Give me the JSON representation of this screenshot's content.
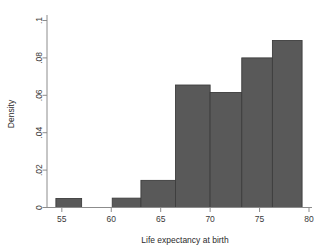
{
  "chart_data": {
    "type": "bar",
    "title": "",
    "subtitle": "",
    "xlabel": "Life expectancy at birth",
    "ylabel": "Density",
    "xlim": [
      53.5,
      80
    ],
    "ylim": [
      0,
      0.103
    ],
    "xticks": [
      "55",
      "60",
      "65",
      "70",
      "75",
      "80"
    ],
    "xtick_values": [
      55,
      60,
      65,
      70,
      75,
      80
    ],
    "yticks": [
      "0",
      ".02",
      ".04",
      ".06",
      ".08",
      ".1"
    ],
    "ytick_values": [
      0,
      0.02,
      0.04,
      0.06,
      0.08,
      0.1
    ],
    "grid": false,
    "legend": "none",
    "bar_color": "#595959",
    "bar_edge_color": "#3d3d3d",
    "background_color": "#ffffff",
    "axis_color": "#8c8c8c",
    "bins": [
      {
        "label": "54.4-57.0",
        "x0": 54.4,
        "x1": 57.0,
        "value": 0.0048
      },
      {
        "label": "60.1-63.0",
        "x0": 60.1,
        "x1": 63.0,
        "value": 0.005
      },
      {
        "label": "63.0-66.5",
        "x0": 63.0,
        "x1": 66.5,
        "value": 0.0145
      },
      {
        "label": "66.5-70.0",
        "x0": 66.5,
        "x1": 70.0,
        "value": 0.0655
      },
      {
        "label": "70.0-73.2",
        "x0": 70.0,
        "x1": 73.2,
        "value": 0.0615
      },
      {
        "label": "73.2-76.3",
        "x0": 73.2,
        "x1": 76.3,
        "value": 0.08
      },
      {
        "label": "76.3-79.3",
        "x0": 76.3,
        "x1": 79.3,
        "value": 0.0893
      }
    ]
  }
}
